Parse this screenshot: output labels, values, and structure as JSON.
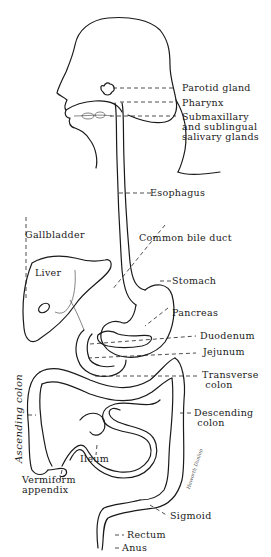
{
  "diagram": {
    "labels": {
      "parotid_gland": "Parotid gland",
      "pharynx": "Pharynx",
      "salivary": "Submaxillary\nand sublingual\nsalivary glands",
      "esophagus": "Esophagus",
      "gallbladder": "Gallbladder",
      "common_bile_duct": "Common bile duct",
      "liver": "Liver",
      "stomach": "Stomach",
      "pancreas": "Pancreas",
      "duodenum": "Duodenum",
      "jejunum": "Jejunum",
      "transverse_colon": "Transverse\n colon",
      "descending_colon": "Descending\n colon",
      "ascending_colon": "Ascending colon",
      "ileum": "Ileum",
      "vermiform_appendix": "Vermiform\nappendix",
      "sigmoid": "Sigmoid",
      "rectum": "Rectum",
      "anus": "Anus"
    },
    "signature": "Haworth Dunlop"
  }
}
